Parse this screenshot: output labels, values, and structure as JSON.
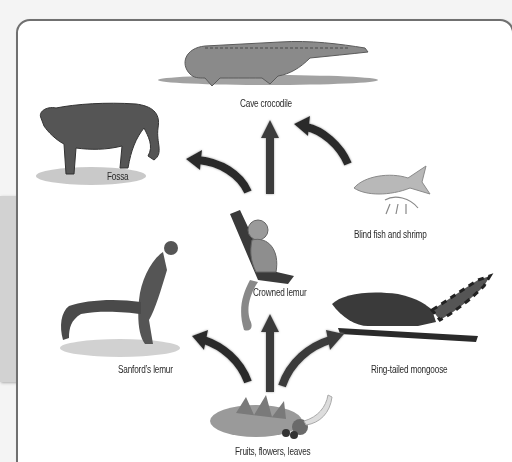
{
  "diagram": {
    "type": "food-web",
    "nodes": [
      {
        "id": "crocodile",
        "label": "Cave crocodile",
        "role": "top predator"
      },
      {
        "id": "fossa",
        "label": "Fossa",
        "role": "predator"
      },
      {
        "id": "fish",
        "label": "Blind fish and shrimp",
        "role": "prey"
      },
      {
        "id": "crowned",
        "label": "Crowned lemur",
        "role": "herbivore"
      },
      {
        "id": "sanford",
        "label": "Sanford’s lemur",
        "role": "herbivore"
      },
      {
        "id": "mongoose",
        "label": "Ring-tailed mongoose",
        "role": "omnivore"
      },
      {
        "id": "plants",
        "label": "Fruits, flowers, leaves",
        "role": "producer"
      }
    ],
    "edges": [
      {
        "from": "crowned",
        "to": "crocodile"
      },
      {
        "from": "fish",
        "to": "crocodile"
      },
      {
        "from": "crowned",
        "to": "fossa"
      },
      {
        "from": "plants",
        "to": "crowned"
      },
      {
        "from": "plants",
        "to": "sanford"
      },
      {
        "from": "plants",
        "to": "mongoose"
      }
    ]
  }
}
